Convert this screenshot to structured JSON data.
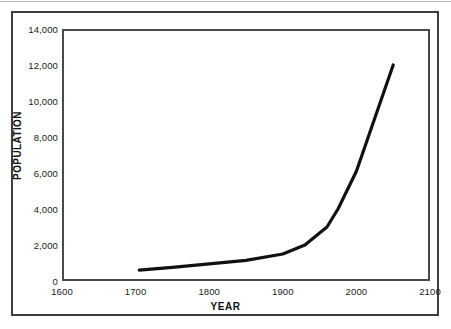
{
  "chart_data": {
    "type": "line",
    "title": "",
    "xlabel": "YEAR",
    "ylabel": "POPULATION",
    "xlim": [
      1600,
      2100
    ],
    "ylim": [
      0,
      14000
    ],
    "grid": false,
    "legend": null,
    "x_ticks": [
      "1600",
      "1700",
      "1800",
      "1900",
      "2000",
      "2100"
    ],
    "x_tick_values": [
      1600,
      1700,
      1800,
      1900,
      2000,
      2100
    ],
    "y_ticks": [
      "0",
      "2,000",
      "4,000",
      "6,000",
      "8,000",
      "10,000",
      "12,000",
      "14,000"
    ],
    "y_tick_values": [
      0,
      2000,
      4000,
      6000,
      8000,
      10000,
      12000,
      14000
    ],
    "series": [
      {
        "name": "World population",
        "x": [
          1705,
          1750,
          1800,
          1850,
          1900,
          1930,
          1960,
          1975,
          2000,
          2050
        ],
        "values": [
          600,
          760,
          950,
          1150,
          1500,
          2000,
          3000,
          4000,
          6100,
          12000
        ]
      }
    ],
    "line_color": "#111111",
    "line_width": 3.2
  },
  "figure": {
    "background_color": "#ffffff",
    "frame_color": "#3d3d3d",
    "axis_color": "#4a4a4a",
    "text_color": "#1a1a1a"
  }
}
